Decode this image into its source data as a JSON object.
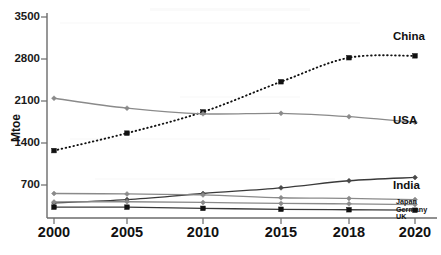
{
  "chart_data": {
    "type": "line",
    "title": "",
    "xlabel": "",
    "ylabel": "Mtoe",
    "x": [
      2000,
      2005,
      2010,
      2015,
      2018,
      2020
    ],
    "xtick_labels": [
      "2000",
      "2005",
      "2010",
      "2015",
      "2018",
      "2020"
    ],
    "ytick_labels": [
      "700",
      "1400",
      "2100",
      "2800",
      "3500"
    ],
    "yticks": [
      700,
      1400,
      2100,
      2800,
      3500
    ],
    "ylim": [
      0,
      3500
    ],
    "xlim": [
      2000,
      2020
    ],
    "grid": false,
    "legend_position": "right-inline",
    "series": [
      {
        "name": "China",
        "label": "China",
        "values": [
          1430,
          1800,
          2250,
          2890,
          3400,
          3440
        ],
        "style": "dotted",
        "marker": "square",
        "color": "#111111"
      },
      {
        "name": "USA",
        "label": "USA",
        "values": [
          2540,
          2330,
          2210,
          2220,
          2150,
          2030
        ],
        "style": "solid",
        "marker": "diamond",
        "color": "#8a8a8a"
      },
      {
        "name": "India",
        "label": "India",
        "values": [
          320,
          390,
          520,
          640,
          790,
          860
        ],
        "style": "solid",
        "marker": "diamond",
        "color": "#3a3a3a"
      },
      {
        "name": "Japan",
        "label": "Japan",
        "values": [
          520,
          510,
          490,
          430,
          415,
          390
        ],
        "style": "solid",
        "marker": "diamond",
        "color": "#8a8a8a"
      },
      {
        "name": "Germany",
        "label": "Germany",
        "values": [
          340,
          345,
          330,
          310,
          300,
          285
        ],
        "style": "solid",
        "marker": "diamond",
        "color": "#8a8a8a"
      },
      {
        "name": "UK",
        "label": "UK",
        "values": [
          230,
          230,
          205,
          185,
          175,
          165
        ],
        "style": "solid",
        "marker": "square",
        "color": "#111111"
      }
    ]
  },
  "axis": {
    "y_title": "Mtoe"
  }
}
